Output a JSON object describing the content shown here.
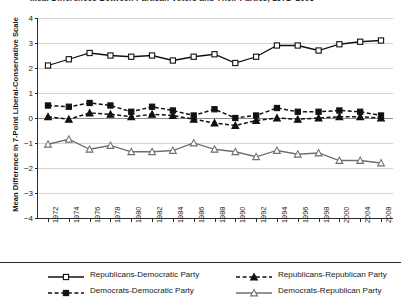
{
  "chart_data": {
    "type": "line",
    "title": "...cal Differences Between Partisan Voters and Their Parties, 1972–2008",
    "xlabel": "",
    "ylabel": "Mean Difference in 7-Point Liberal-Conservative Scale",
    "ylim": [
      -4,
      4
    ],
    "ytick_labels": [
      "4",
      "3",
      "2",
      "1",
      "0",
      "−1",
      "−2",
      "−3",
      "−4"
    ],
    "ytick_values": [
      4,
      3,
      2,
      1,
      0,
      -1,
      -2,
      -3,
      -4
    ],
    "grid": true,
    "legend_position": "bottom",
    "categories": [
      "1972",
      "1974",
      "1976",
      "1978",
      "1980",
      "1982",
      "1984",
      "1986",
      "1988",
      "1990",
      "1992",
      "1994",
      "1996",
      "1998",
      "2000",
      "2004",
      "2008"
    ],
    "series": [
      {
        "name": "Republicans-Democratic Party",
        "marker": "open-square",
        "line": "solid",
        "values": [
          2.1,
          2.35,
          2.6,
          2.5,
          2.45,
          2.5,
          2.3,
          2.45,
          2.55,
          2.2,
          2.45,
          2.9,
          2.9,
          2.7,
          2.95,
          3.05,
          3.1
        ]
      },
      {
        "name": "Republicans-Republican Party",
        "marker": "filled-triangle",
        "line": "dashed",
        "values": [
          0.05,
          -0.05,
          0.2,
          0.15,
          0.05,
          0.15,
          0.1,
          -0.05,
          -0.2,
          -0.3,
          -0.1,
          0.0,
          -0.05,
          0.0,
          0.05,
          0.05,
          0.0
        ]
      },
      {
        "name": "Democrats-Democratic Party",
        "marker": "filled-square",
        "line": "dashed",
        "values": [
          0.5,
          0.45,
          0.6,
          0.5,
          0.25,
          0.45,
          0.3,
          0.1,
          0.35,
          0.0,
          0.1,
          0.4,
          0.25,
          0.25,
          0.3,
          0.25,
          0.1
        ]
      },
      {
        "name": "Democrats-Republican Party",
        "marker": "open-triangle",
        "line": "solid",
        "values": [
          -1.05,
          -0.85,
          -1.25,
          -1.1,
          -1.35,
          -1.35,
          -1.3,
          -1.0,
          -1.25,
          -1.35,
          -1.55,
          -1.3,
          -1.45,
          -1.4,
          -1.7,
          -1.7,
          -1.8
        ]
      }
    ]
  },
  "legend": {
    "items": [
      {
        "label": "Republicans-Democratic Party",
        "marker": "open-square",
        "line": "solid"
      },
      {
        "label": "Republicans-Republican Party",
        "marker": "filled-triangle",
        "line": "dashed"
      },
      {
        "label": "Democrats-Democratic Party",
        "marker": "filled-square",
        "line": "dashed"
      },
      {
        "label": "Democrats-Republican Party",
        "marker": "open-triangle",
        "line": "solid"
      }
    ]
  },
  "colors": {
    "ink": "#1a1a1a",
    "axis": "#2b2b2b",
    "grid": "#d3d3d3",
    "zero": "#8c8c8c",
    "series_dark": "#111111",
    "series_gray": "#6f6f6f"
  }
}
